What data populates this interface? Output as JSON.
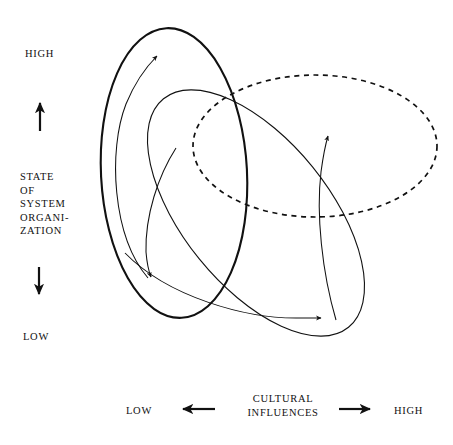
{
  "diagram": {
    "type": "conceptual-ellipse-diagram",
    "background_color": "#ffffff",
    "stroke_color": "#111111",
    "y_axis": {
      "high_label": "HIGH",
      "low_label": "LOW",
      "title_lines": [
        "STATE",
        "OF",
        "SYSTEM",
        "ORGANI-",
        "ZATION"
      ],
      "up_arrow": "↑",
      "down_arrow": "↓"
    },
    "x_axis": {
      "low_label": "LOW",
      "high_label": "HIGH",
      "title_lines": [
        "CULTURAL",
        "INFLUENCES"
      ],
      "left_arrow": "←",
      "right_arrow": "→"
    },
    "shapes": [
      {
        "name": "thick-vertical-ellipse",
        "style": "solid",
        "stroke_width": 2.1,
        "cx": 174,
        "cy": 173,
        "rx": 73,
        "ry": 145,
        "rotation": -3
      },
      {
        "name": "tilted-thin-ellipse",
        "style": "solid",
        "stroke_width": 1.1,
        "cx": 256,
        "cy": 213,
        "rx": 147,
        "ry": 73,
        "rotation": 51
      },
      {
        "name": "dashed-horizontal-ellipse",
        "style": "dashed",
        "stroke_width": 1.7,
        "cx": 315,
        "cy": 146,
        "rx": 122,
        "ry": 71,
        "rotation": 0
      }
    ],
    "flow_arrows": [
      {
        "name": "upward-left-flow-arrow",
        "direction": "up"
      },
      {
        "name": "downward-left-flow-arrow",
        "direction": "down"
      },
      {
        "name": "downward-right-flow-arrow",
        "direction": "down"
      },
      {
        "name": "upward-right-flow-arrow",
        "direction": "up"
      }
    ]
  }
}
